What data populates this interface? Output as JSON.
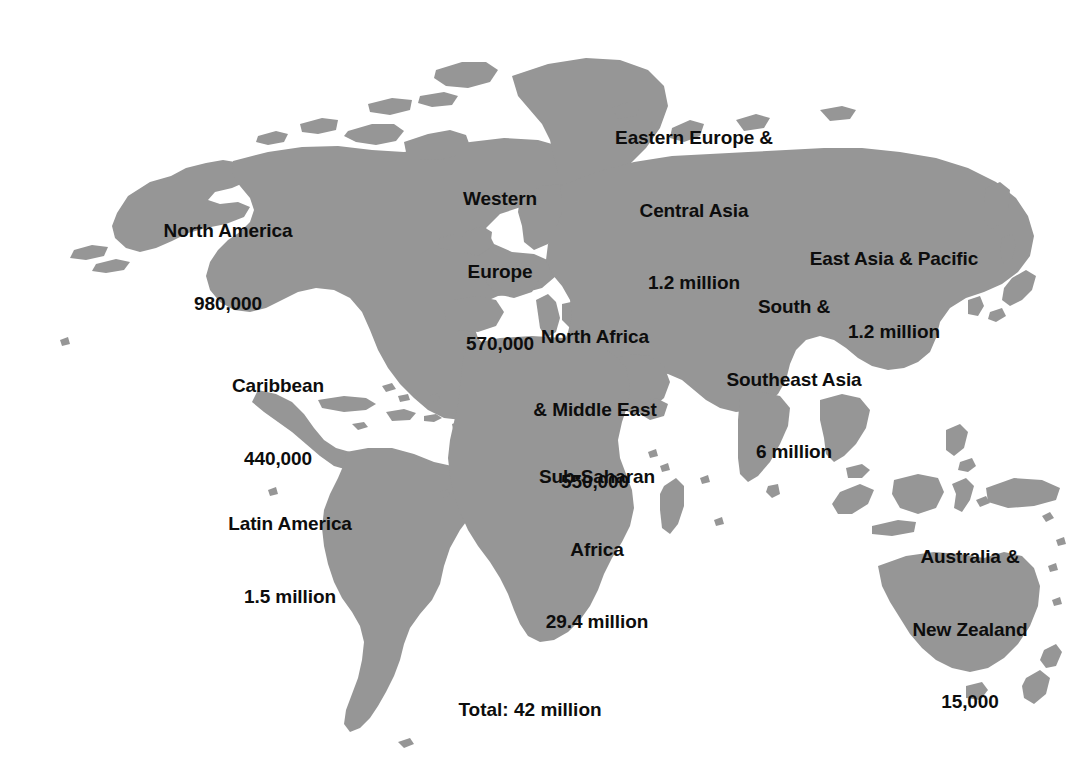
{
  "figure": {
    "type": "world-map-infographic",
    "background_color": "#ffffff",
    "land_color": "#969696",
    "text_color": "#0d0d0d",
    "width": 1072,
    "height": 784
  },
  "regions": [
    {
      "id": "north-america",
      "name": "North America",
      "value_text": "980,000",
      "lines": [
        "North America",
        "980,000"
      ],
      "x": 228,
      "y": 267
    },
    {
      "id": "western-europe",
      "name": "Western Europe",
      "value_text": "570,000",
      "lines": [
        "Western",
        "Europe",
        "570,000"
      ],
      "x": 500,
      "y": 272
    },
    {
      "id": "eastern-europe-central-asia",
      "name": "Eastern Europe & Central Asia",
      "value_text": "1.2 million",
      "lines": [
        "Eastern Europe &",
        "Central Asia",
        "1.2 million"
      ],
      "x": 694,
      "y": 211
    },
    {
      "id": "east-asia-pacific",
      "name": "East Asia & Pacific",
      "value_text": "1.2 million",
      "lines": [
        "East Asia & Pacific",
        "1.2 million"
      ],
      "x": 894,
      "y": 295
    },
    {
      "id": "caribbean",
      "name": "Caribbean",
      "value_text": "440,000",
      "lines": [
        "Caribbean",
        "440,000"
      ],
      "x": 278,
      "y": 422
    },
    {
      "id": "north-africa-middle-east",
      "name": "North Africa & Middle East",
      "value_text": "550,000",
      "lines": [
        "North Africa",
        "& Middle East",
        "550,000"
      ],
      "x": 595,
      "y": 410
    },
    {
      "id": "south-southeast-asia",
      "name": "South & Southeast Asia",
      "value_text": "6 million",
      "lines": [
        "South &",
        "Southeast Asia",
        "6 million"
      ],
      "x": 794,
      "y": 380
    },
    {
      "id": "latin-america",
      "name": "Latin America",
      "value_text": "1.5 million",
      "lines": [
        "Latin America",
        "1.5 million"
      ],
      "x": 290,
      "y": 560
    },
    {
      "id": "sub-saharan-africa",
      "name": "Sub-Saharan Africa",
      "value_text": "29.4 million",
      "lines": [
        "Sub-Saharan",
        "Africa",
        "29.4 million"
      ],
      "x": 597,
      "y": 550
    },
    {
      "id": "australia-new-zealand",
      "name": "Australia & New Zealand",
      "value_text": "15,000",
      "lines": [
        "Australia &",
        "New Zealand",
        "15,000"
      ],
      "x": 970,
      "y": 630
    }
  ],
  "total": {
    "text": "Total: 42 million",
    "x": 530,
    "y": 710
  },
  "chart_data": {
    "type": "map",
    "title": "Total: 42 million",
    "categories": [
      "North America",
      "Western Europe",
      "Eastern Europe & Central Asia",
      "East Asia & Pacific",
      "Caribbean",
      "North Africa & Middle East",
      "South & Southeast Asia",
      "Latin America",
      "Sub-Saharan Africa",
      "Australia & New Zealand"
    ],
    "values": [
      980000,
      570000,
      1200000,
      1200000,
      440000,
      550000,
      6000000,
      1500000,
      29400000,
      15000
    ],
    "value_labels": [
      "980,000",
      "570,000",
      "1.2 million",
      "1.2 million",
      "440,000",
      "550,000",
      "6 million",
      "1.5 million",
      "29.4 million",
      "15,000"
    ],
    "total": 42000000,
    "total_label": "42 million",
    "legend": "none",
    "grid": false
  }
}
